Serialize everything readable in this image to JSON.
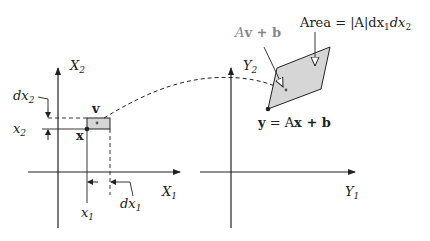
{
  "diagram": {
    "left_panel": {
      "axis_x_label": "X",
      "axis_x_sub": "1",
      "axis_y_label": "X",
      "axis_y_sub": "2",
      "point_label": "x",
      "vertex_label": "v",
      "x1_label": "x",
      "x1_sub": "1",
      "x2_label": "x",
      "x2_sub": "2",
      "dx1_label": "dx",
      "dx1_sub": "1",
      "dx2_label": "dx",
      "dx2_sub": "2"
    },
    "right_panel": {
      "axis_x_label": "Y",
      "axis_x_sub": "1",
      "axis_y_label": "Y",
      "axis_y_sub": "2",
      "mapped_vertex_label": "Av + b",
      "mapped_vertex_A": "A",
      "mapped_vertex_rest": "v + b",
      "area_label": "Area = |A|dx",
      "area_sub1": "1",
      "area_mid": "dx",
      "area_sub2": "2",
      "point_eq_y": "y",
      "point_eq_mid": " = A",
      "point_eq_x": "x",
      "point_eq_end": " + b"
    },
    "colors": {
      "stroke": "#222222",
      "fill": "#d6d6d6",
      "muted_label": "#888888"
    }
  }
}
